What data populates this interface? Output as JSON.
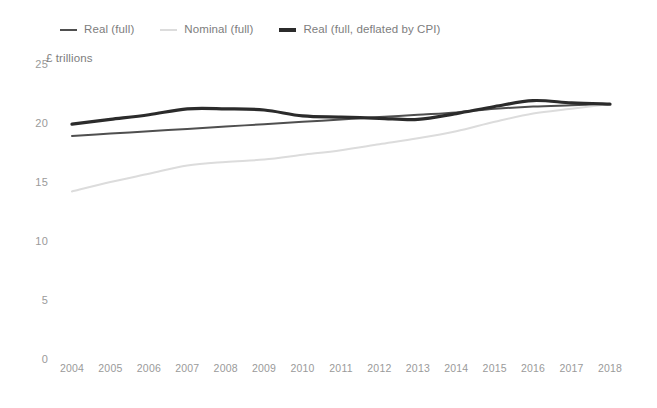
{
  "legend": {
    "position": "top-left",
    "items": [
      {
        "label": "Real (full)",
        "color": "#4f4f4f",
        "width": 2.0
      },
      {
        "label": "Nominal (full)",
        "color": "#dcdcdc",
        "width": 2.0
      },
      {
        "label": "Real (full, deflated by CPI)",
        "color": "#2b2b2b",
        "width": 3.2
      }
    ]
  },
  "axis": {
    "y_title": "£ trillions",
    "y_ticks": [
      "0",
      "5",
      "10",
      "15",
      "20",
      "25"
    ],
    "x_ticks": [
      "2004",
      "2005",
      "2006",
      "2007",
      "2008",
      "2009",
      "2010",
      "2011",
      "2012",
      "2013",
      "2014",
      "2015",
      "2016",
      "2017",
      "2018"
    ]
  },
  "chart_data": {
    "type": "line",
    "title": "",
    "subtitle": "",
    "xlabel": "",
    "ylabel": "£ trillions",
    "ylim": [
      0,
      25
    ],
    "xlim": [
      2004,
      2018
    ],
    "grid": false,
    "legend_position": "top-left",
    "x": [
      2004,
      2005,
      2006,
      2007,
      2008,
      2009,
      2010,
      2011,
      2012,
      2013,
      2014,
      2015,
      2016,
      2017,
      2018
    ],
    "categories": [
      "2004",
      "2005",
      "2006",
      "2007",
      "2008",
      "2009",
      "2010",
      "2011",
      "2012",
      "2013",
      "2014",
      "2015",
      "2016",
      "2017",
      "2018"
    ],
    "series": [
      {
        "name": "Real (full)",
        "color": "#4f4f4f",
        "line_width": 2.0,
        "values": [
          18.9,
          19.1,
          19.3,
          19.5,
          19.7,
          19.9,
          20.1,
          20.3,
          20.5,
          20.7,
          20.9,
          21.2,
          21.4,
          21.5,
          21.6
        ]
      },
      {
        "name": "Nominal (full)",
        "color": "#dcdcdc",
        "line_width": 2.0,
        "values": [
          14.2,
          15.0,
          15.7,
          16.4,
          16.7,
          16.9,
          17.3,
          17.7,
          18.2,
          18.7,
          19.3,
          20.1,
          20.8,
          21.2,
          21.6
        ]
      },
      {
        "name": "Real (full, deflated by CPI)",
        "color": "#2b2b2b",
        "line_width": 3.2,
        "values": [
          19.9,
          20.3,
          20.7,
          21.2,
          21.2,
          21.1,
          20.6,
          20.5,
          20.4,
          20.3,
          20.8,
          21.4,
          21.9,
          21.7,
          21.6
        ]
      }
    ]
  }
}
